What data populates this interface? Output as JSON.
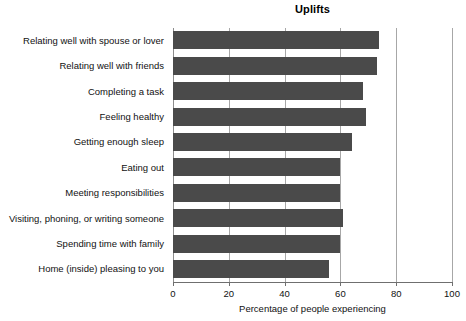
{
  "chart_data": {
    "type": "bar",
    "orientation": "horizontal",
    "title": "Uplifts",
    "xlabel": "Percentage of people experiencing",
    "ylabel": "",
    "xlim": [
      0,
      100
    ],
    "xticks": [
      0,
      20,
      40,
      60,
      80,
      100
    ],
    "xtick_labels": [
      "0",
      "20",
      "40",
      "60",
      "80",
      "100"
    ],
    "grid": true,
    "grid_axis": "x",
    "legend": false,
    "bar_color": "#4a4a4a",
    "categories": [
      "Relating well with spouse or lover",
      "Relating well with friends",
      "Completing a task",
      "Feeling healthy",
      "Getting enough sleep",
      "Eating out",
      "Meeting responsibilities",
      "Visiting, phoning, or writing someone",
      "Spending time with family",
      "Home (inside) pleasing to you"
    ],
    "values": [
      74,
      73,
      68,
      69,
      64,
      60,
      60,
      61,
      60,
      56
    ]
  }
}
